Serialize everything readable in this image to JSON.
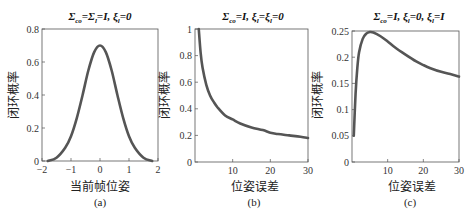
{
  "chart_data": [
    {
      "type": "line",
      "panel": "(a)",
      "title": "Σ_co=Σ_l=I, ξ_l=0",
      "xlabel": "当前帧位姿",
      "ylabel": "闭环概率",
      "xlim": [
        -2,
        2
      ],
      "ylim": [
        0,
        0.8
      ],
      "xticks": [
        "-2",
        "-1",
        "0",
        "1",
        "2"
      ],
      "yticks": [
        "0",
        "0.2",
        "0.4",
        "0.6",
        "0.8"
      ],
      "grid": false,
      "series": [
        {
          "name": "closure-probability",
          "x": [
            -1.8,
            -1.5,
            -1.2,
            -1.0,
            -0.8,
            -0.6,
            -0.4,
            -0.2,
            0,
            0.2,
            0.4,
            0.6,
            0.8,
            1.0,
            1.2,
            1.5,
            1.8
          ],
          "y": [
            0.0,
            0.02,
            0.08,
            0.15,
            0.26,
            0.4,
            0.55,
            0.66,
            0.7,
            0.66,
            0.55,
            0.4,
            0.26,
            0.15,
            0.08,
            0.02,
            0.0
          ]
        }
      ]
    },
    {
      "type": "line",
      "panel": "(b)",
      "title": "Σ_co=I, ξ_l=ξ_l=0",
      "xlabel": "位姿误差",
      "ylabel": "闭环概率",
      "xlim": [
        0,
        30
      ],
      "ylim": [
        0,
        1
      ],
      "xticks": [
        "10",
        "20",
        "30"
      ],
      "yticks": [
        "0",
        "0.2",
        "0.4",
        "0.6",
        "0.8",
        "1"
      ],
      "grid": false,
      "series": [
        {
          "name": "closure-probability",
          "x": [
            1,
            1.5,
            2,
            3,
            4,
            5,
            6,
            8,
            10,
            12,
            15,
            18,
            20,
            22,
            25,
            28,
            30
          ],
          "y": [
            1.0,
            0.82,
            0.71,
            0.58,
            0.5,
            0.45,
            0.41,
            0.35,
            0.32,
            0.29,
            0.26,
            0.24,
            0.22,
            0.21,
            0.2,
            0.19,
            0.18
          ]
        }
      ]
    },
    {
      "type": "line",
      "panel": "(c)",
      "title": "Σ_co=I, ξ_l=0, ξ_l=I",
      "xlabel": "位姿误差",
      "ylabel": "闭环概率",
      "xlim": [
        0,
        30
      ],
      "ylim": [
        0,
        0.25
      ],
      "xticks": [
        "10",
        "20",
        "30"
      ],
      "yticks": [
        "0",
        "0.05",
        "0.1",
        "0.15",
        "0.2",
        "0.25"
      ],
      "grid": false,
      "series": [
        {
          "name": "closure-probability",
          "x": [
            0.5,
            1,
            1.5,
            2,
            3,
            4,
            5,
            6,
            8,
            10,
            12,
            15,
            18,
            20,
            22,
            25,
            28,
            30
          ],
          "y": [
            0.05,
            0.13,
            0.18,
            0.21,
            0.235,
            0.245,
            0.248,
            0.247,
            0.24,
            0.23,
            0.219,
            0.205,
            0.192,
            0.185,
            0.179,
            0.172,
            0.167,
            0.163
          ]
        }
      ]
    }
  ],
  "panels": [
    {
      "title_main": "Σ",
      "title_text": [
        "Σ",
        "co",
        "=Σ",
        "l",
        "=I,  ξ",
        "l",
        "=0"
      ],
      "xlabel": "当前帧位姿",
      "ylabel": "闭环概率",
      "caption": "(a)"
    },
    {
      "title_text": [
        "Σ",
        "co",
        "=I,  ξ",
        "l",
        "=ξ",
        "l",
        "=0"
      ],
      "xlabel": "位姿误差",
      "ylabel": "闭环概率",
      "caption": "(b)"
    },
    {
      "title_text": [
        "Σ",
        "co",
        "=I,  ξ",
        "l",
        "=0,  ξ",
        "l",
        "=I"
      ],
      "xlabel": "位姿误差",
      "ylabel": "闭环概率",
      "caption": "(c)"
    }
  ],
  "colors": {
    "curve": "#555555",
    "frame": "#555555",
    "text": "#222222"
  }
}
